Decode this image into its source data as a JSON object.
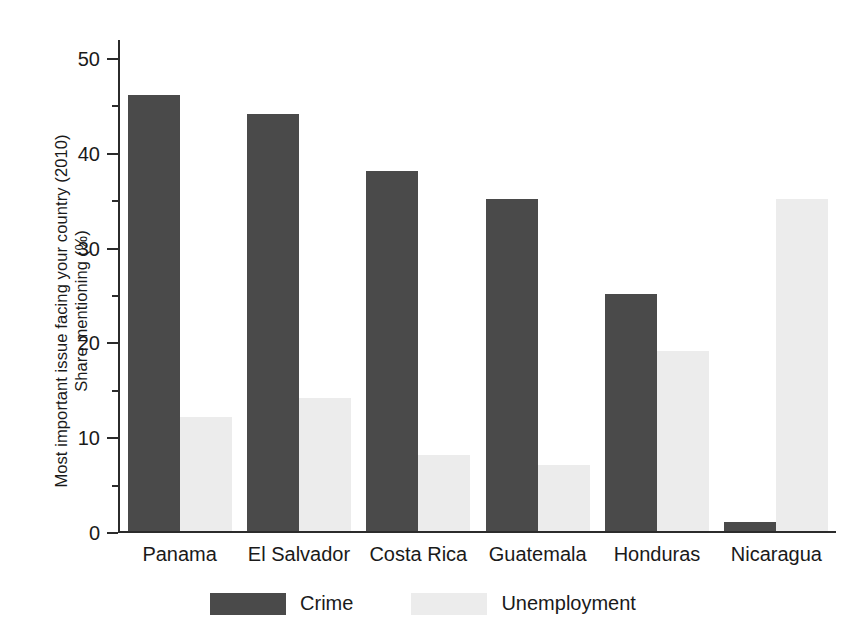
{
  "chart_data": {
    "type": "bar",
    "title": "",
    "subtitle": "",
    "xlabel": "",
    "ylabel": "Most important issue facing your country (2010) Share mentioning (%)",
    "ylabel_lines": [
      "Most important issue facing your country (2010)",
      "Share mentioning (%)"
    ],
    "categories": [
      "Panama",
      "El Salvador",
      "Costa Rica",
      "Guatemala",
      "Honduras",
      "Nicaragua"
    ],
    "series": [
      {
        "name": "Crime",
        "color": "#4a4a4a",
        "values": [
          46,
          44,
          38,
          35,
          25,
          1
        ]
      },
      {
        "name": "Unemployment",
        "color": "#ececec",
        "values": [
          12,
          14,
          8,
          7,
          19,
          35
        ]
      }
    ],
    "ylim": [
      0,
      52
    ],
    "yticks": [
      0,
      10,
      20,
      30,
      40,
      50
    ],
    "ytick_labels": [
      "0",
      "10",
      "20",
      "30",
      "40",
      "50"
    ],
    "yminor_ticks": [
      5,
      15,
      25,
      35,
      45
    ],
    "grid": false,
    "legend_position": "bottom-center",
    "axis_color": "#2b2b2b",
    "background_color": "#ffffff"
  },
  "legend": {
    "items": [
      {
        "label": "Crime",
        "color": "#4a4a4a"
      },
      {
        "label": "Unemployment",
        "color": "#ececec"
      }
    ]
  }
}
